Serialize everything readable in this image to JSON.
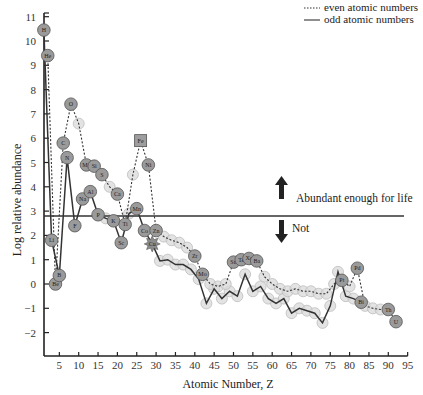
{
  "chart_data": {
    "type": "line",
    "title": "",
    "xlabel": "Atomic Number, Z",
    "ylabel": "Log relative abundance",
    "xlim": [
      1,
      95
    ],
    "ylim": [
      -3,
      11
    ],
    "xticks": [
      5,
      10,
      15,
      20,
      25,
      30,
      35,
      40,
      45,
      50,
      55,
      60,
      65,
      70,
      75,
      80,
      85,
      90,
      95
    ],
    "yticks": [
      -2,
      -1,
      0,
      1,
      2,
      3,
      4,
      5,
      6,
      7,
      8,
      9,
      10,
      11
    ],
    "grid": false,
    "legend": {
      "position": "top-right",
      "entries": [
        {
          "label": "even atomic numbers",
          "style": "dotted"
        },
        {
          "label": "odd atomic numbers",
          "style": "solid"
        }
      ]
    },
    "threshold": {
      "value": 2.8,
      "above_label": "Abundant enough for life",
      "below_label": "Not"
    },
    "labeled_elements": [
      {
        "symbol": "H",
        "z": 1,
        "value": 10.45
      },
      {
        "symbol": "He",
        "z": 2,
        "value": 9.4
      },
      {
        "symbol": "Li",
        "z": 3,
        "value": 1.8
      },
      {
        "symbol": "Be",
        "z": 4,
        "value": 0.0
      },
      {
        "symbol": "B",
        "z": 5,
        "value": 0.35
      },
      {
        "symbol": "C",
        "z": 6,
        "value": 5.8
      },
      {
        "symbol": "N",
        "z": 7,
        "value": 5.2
      },
      {
        "symbol": "O",
        "z": 8,
        "value": 7.4
      },
      {
        "symbol": "F",
        "z": 9,
        "value": 2.4
      },
      {
        "symbol": "Na",
        "z": 11,
        "value": 3.5
      },
      {
        "symbol": "Mg",
        "z": 12,
        "value": 4.9
      },
      {
        "symbol": "Al",
        "z": 13,
        "value": 3.8
      },
      {
        "symbol": "Si",
        "z": 14,
        "value": 4.85
      },
      {
        "symbol": "P",
        "z": 15,
        "value": 2.85
      },
      {
        "symbol": "S",
        "z": 16,
        "value": 4.5
      },
      {
        "symbol": "K",
        "z": 19,
        "value": 2.6
      },
      {
        "symbol": "Ca",
        "z": 20,
        "value": 3.7
      },
      {
        "symbol": "Sc",
        "z": 21,
        "value": 1.7
      },
      {
        "symbol": "Ti",
        "z": 22,
        "value": 2.45
      },
      {
        "symbol": "Mn",
        "z": 25,
        "value": 3.1
      },
      {
        "symbol": "Fe",
        "z": 26,
        "value": 5.9
      },
      {
        "symbol": "Co",
        "z": 27,
        "value": 2.2
      },
      {
        "symbol": "Ni",
        "z": 28,
        "value": 4.9
      },
      {
        "symbol": "Zn",
        "z": 30,
        "value": 2.2
      },
      {
        "symbol": "Cu",
        "z": 29,
        "value": 1.65
      },
      {
        "symbol": "Zr",
        "z": 40,
        "value": 1.15
      },
      {
        "symbol": "Mo",
        "z": 42,
        "value": 0.4
      },
      {
        "symbol": "Sn",
        "z": 50,
        "value": 0.9
      },
      {
        "symbol": "Te",
        "z": 52,
        "value": 1.0
      },
      {
        "symbol": "Xe",
        "z": 54,
        "value": 1.05
      },
      {
        "symbol": "Ba",
        "z": 56,
        "value": 0.95
      },
      {
        "symbol": "Pt",
        "z": 78,
        "value": 0.15
      },
      {
        "symbol": "Pd",
        "z": 82,
        "value": 0.65
      },
      {
        "symbol": "Bi",
        "z": 83,
        "value": -0.75
      },
      {
        "symbol": "Th",
        "z": 90,
        "value": -1.05
      },
      {
        "symbol": "U",
        "z": 92,
        "value": -1.55
      }
    ],
    "series": [
      {
        "name": "odd atomic numbers",
        "style": "solid",
        "x": [
          1,
          3,
          5,
          7,
          9,
          11,
          13,
          15,
          17,
          19,
          21,
          23,
          25,
          27,
          29,
          31,
          33,
          35,
          37,
          39,
          41,
          43,
          45,
          47,
          49,
          51,
          53,
          55,
          57,
          59,
          61,
          63,
          65,
          67,
          69,
          71,
          73,
          75,
          77,
          79,
          81,
          83
        ],
        "values": [
          10.45,
          1.8,
          0.35,
          5.2,
          2.4,
          3.5,
          3.8,
          2.85,
          2.7,
          2.6,
          1.7,
          2.9,
          3.1,
          2.2,
          1.65,
          0.95,
          1.0,
          0.8,
          0.8,
          0.6,
          0.2,
          -0.8,
          -0.2,
          -0.6,
          -0.3,
          -0.5,
          0.4,
          -0.3,
          -0.1,
          -0.6,
          -0.8,
          -0.6,
          -1.2,
          -1.0,
          -1.1,
          -1.2,
          -1.6,
          -0.9,
          0.5,
          -0.5,
          -0.6,
          -0.75
        ]
      },
      {
        "name": "even atomic numbers",
        "style": "dotted",
        "x": [
          2,
          4,
          6,
          8,
          10,
          12,
          14,
          16,
          18,
          20,
          22,
          24,
          26,
          28,
          30,
          32,
          34,
          36,
          38,
          40,
          42,
          44,
          46,
          48,
          50,
          52,
          54,
          56,
          58,
          60,
          62,
          64,
          66,
          68,
          70,
          72,
          74,
          76,
          78,
          80,
          82,
          84,
          86,
          88,
          90,
          92
        ],
        "values": [
          9.4,
          0.0,
          5.8,
          7.4,
          6.6,
          4.9,
          4.85,
          4.5,
          4.0,
          3.7,
          2.45,
          4.5,
          5.9,
          4.9,
          2.2,
          1.95,
          1.8,
          1.7,
          1.5,
          1.15,
          0.4,
          0.0,
          -0.1,
          0.0,
          0.9,
          1.0,
          1.05,
          0.95,
          0.3,
          0.0,
          -0.2,
          -0.3,
          -0.2,
          -0.3,
          -0.3,
          -0.4,
          -0.4,
          0.0,
          0.15,
          -0.1,
          0.65,
          -0.9,
          -1.0,
          -1.05,
          -1.05,
          -1.55
        ]
      }
    ]
  }
}
